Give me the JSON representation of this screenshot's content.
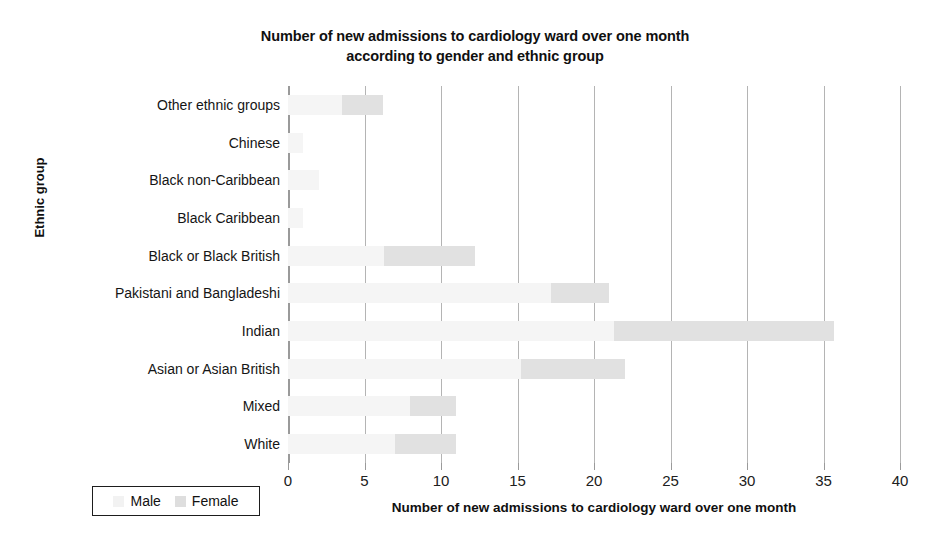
{
  "chart_data": {
    "type": "bar",
    "orientation": "horizontal",
    "stacked": true,
    "title": "Number of new admissions to cardiology ward over one month according to gender and ethnic group",
    "title_line1": "Number of new admissions to cardiology ward over one month",
    "title_line2": "according to gender and ethnic group",
    "xlabel": "Number of new admissions to cardiology ward over one month",
    "ylabel": "Ethnic group",
    "xlim": [
      0,
      40
    ],
    "xticks": [
      0,
      5,
      10,
      15,
      20,
      25,
      30,
      35,
      40
    ],
    "xtick_labels": [
      "0",
      "5",
      "10",
      "15",
      "20",
      "25",
      "30",
      "35",
      "40"
    ],
    "grid": true,
    "grid_axis": "x",
    "legend_position": "bottom-left",
    "categories": [
      "Other ethnic groups",
      "Chinese",
      "Black non-Caribbean",
      "Black Caribbean",
      "Black or Black British",
      "Pakistani and Bangladeshi",
      "Indian",
      "Asian or Asian British",
      "Mixed",
      "White"
    ],
    "series": [
      {
        "name": "Male",
        "color": "#f5f5f5",
        "values": [
          3.5,
          1,
          2,
          1,
          6.3,
          17.2,
          21.3,
          15.2,
          8,
          7
        ]
      },
      {
        "name": "Female",
        "color": "#e1e1e1",
        "values": [
          2.7,
          0,
          0,
          0,
          5.9,
          3.8,
          14.4,
          6.8,
          3,
          4
        ]
      }
    ],
    "totals": [
      6.2,
      1,
      2,
      1,
      12.2,
      21,
      35.7,
      22,
      11,
      11
    ]
  },
  "legend": {
    "items": [
      {
        "label": "Male",
        "swatch": "male"
      },
      {
        "label": "Female",
        "swatch": "female"
      }
    ]
  }
}
